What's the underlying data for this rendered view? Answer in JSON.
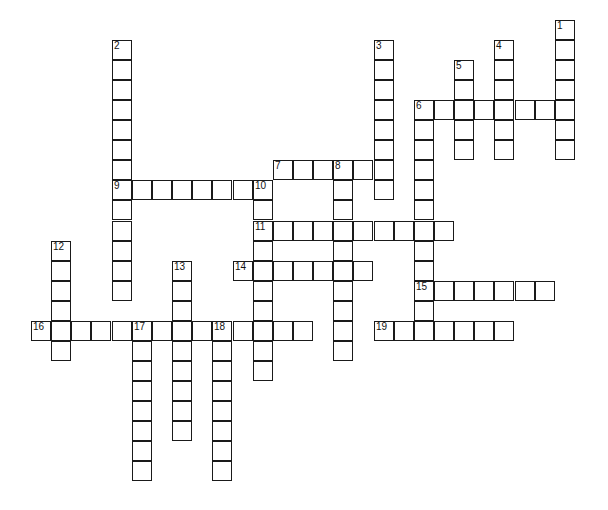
{
  "puzzle": {
    "type": "crossword",
    "grid": {
      "origin_x": 32,
      "origin_y": 21,
      "cell_w": 20.15,
      "cell_h": 20.05
    },
    "colors": {
      "line": "#1a1a1a",
      "cell": "#ffffff",
      "background": "#ffffff"
    },
    "entries": [
      {
        "number": "1",
        "direction": "down",
        "col": 26,
        "row": 0,
        "length": 7
      },
      {
        "number": "2",
        "direction": "down",
        "col": 4,
        "row": 1,
        "length": 13
      },
      {
        "number": "3",
        "direction": "down",
        "col": 17,
        "row": 1,
        "length": 8
      },
      {
        "number": "4",
        "direction": "down",
        "col": 23,
        "row": 1,
        "length": 6
      },
      {
        "number": "5",
        "direction": "down",
        "col": 21,
        "row": 2,
        "length": 5
      },
      {
        "number": "6",
        "direction": "across",
        "col": 19,
        "row": 4,
        "length": 8
      },
      {
        "number": "6",
        "direction": "down",
        "col": 19,
        "row": 4,
        "length": 11
      },
      {
        "number": "7",
        "direction": "across",
        "col": 12,
        "row": 7,
        "length": 6
      },
      {
        "number": "8",
        "direction": "down",
        "col": 15,
        "row": 7,
        "length": 10
      },
      {
        "number": "9",
        "direction": "across",
        "col": 4,
        "row": 8,
        "length": 8
      },
      {
        "number": "10",
        "direction": "down",
        "col": 11,
        "row": 8,
        "length": 10
      },
      {
        "number": "11",
        "direction": "across",
        "col": 11,
        "row": 10,
        "length": 10
      },
      {
        "number": "12",
        "direction": "down",
        "col": 1,
        "row": 11,
        "length": 6
      },
      {
        "number": "13",
        "direction": "down",
        "col": 7,
        "row": 12,
        "length": 9
      },
      {
        "number": "14",
        "direction": "across",
        "col": 10,
        "row": 12,
        "length": 7
      },
      {
        "number": "15",
        "direction": "across",
        "col": 19,
        "row": 13,
        "length": 7
      },
      {
        "number": "16",
        "direction": "across",
        "col": 0,
        "row": 15,
        "length": 14
      },
      {
        "number": "17",
        "direction": "down",
        "col": 5,
        "row": 15,
        "length": 8
      },
      {
        "number": "18",
        "direction": "down",
        "col": 9,
        "row": 15,
        "length": 8
      },
      {
        "number": "19",
        "direction": "across",
        "col": 17,
        "row": 15,
        "length": 7
      }
    ]
  }
}
